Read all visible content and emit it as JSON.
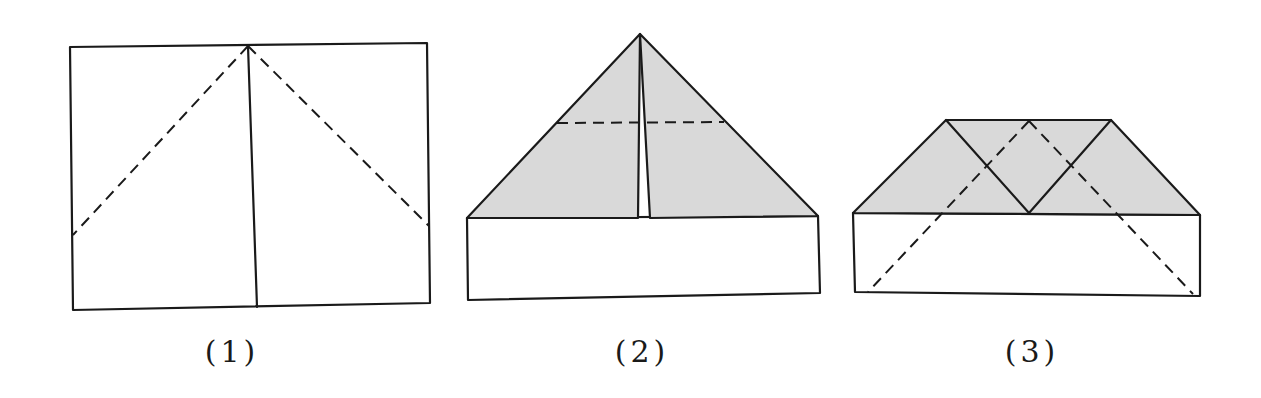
{
  "diagram": {
    "type": "paper-folding-steps",
    "colors": {
      "line": "#1a1a1a",
      "shaded_fold": "#d9d9d9",
      "background": "#ffffff"
    },
    "steps": [
      {
        "label": "(1)",
        "description": "Rectangle with vertical center line and two dashed diagonal fold lines from top center to sides"
      },
      {
        "label": "(2)",
        "description": "Top corners folded to center forming shaded triangle with horizontal dashed fold line"
      },
      {
        "label": "(3)",
        "description": "Tip folded down forming shaded trapezoid with crossing solid lines and dashed diagonals"
      }
    ]
  }
}
